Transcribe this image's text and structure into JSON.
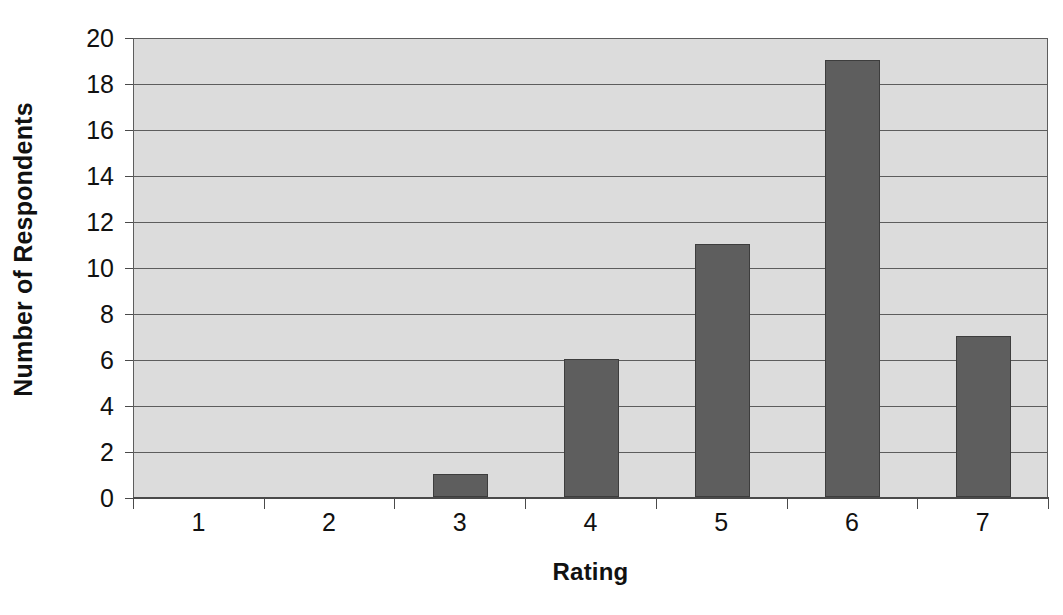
{
  "chart_data": {
    "type": "bar",
    "title": "",
    "subtitle": "",
    "xlabel": "Rating",
    "ylabel": "Number of Respondents",
    "categories": [
      "1",
      "2",
      "3",
      "4",
      "5",
      "6",
      "7"
    ],
    "values": [
      0,
      0,
      1,
      6,
      11,
      19,
      7
    ],
    "series": [
      {
        "name": "Number of Respondents",
        "values": [
          0,
          0,
          1,
          6,
          11,
          19,
          7
        ]
      }
    ],
    "ylim": [
      0,
      20
    ],
    "y_ticks": [
      0,
      2,
      4,
      6,
      8,
      10,
      12,
      14,
      16,
      18,
      20
    ],
    "y_tick_labels": [
      "0",
      "2",
      "4",
      "6",
      "8",
      "10",
      "12",
      "14",
      "16",
      "18",
      "20"
    ],
    "x_tick_labels": [
      "1",
      "2",
      "3",
      "4",
      "5",
      "6",
      "7"
    ],
    "grid": true,
    "grid_axis": "y",
    "legend": false,
    "legend_position": "none",
    "annotations": [],
    "colors": {
      "bar_fill": "#5e5e5e",
      "bar_edge": "#3d3d3d",
      "plot_background": "#dcdcdc",
      "gridline": "#5d5d5d",
      "axis": "#4a4a4a",
      "text": "#111111",
      "figure_background": "#ffffff"
    }
  }
}
